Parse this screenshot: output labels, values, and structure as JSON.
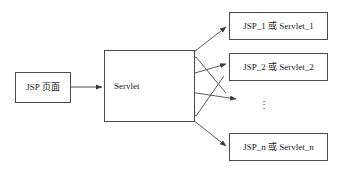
{
  "page": {
    "width": 338,
    "height": 172,
    "background": "#ffffff",
    "stroke_color": "#4a4a4a",
    "text_color": "#1c1c1c",
    "clipped_header_text": "· ···· ··· ··· ·· ··"
  },
  "diagram": {
    "type": "flow-diagram",
    "source": {
      "label": "JSP 页面"
    },
    "dispatcher": {
      "label": "Servlet"
    },
    "targets": [
      {
        "label": "JSP_1 或 Servlet_1"
      },
      {
        "label": "JSP_2 或 Servlet_2"
      },
      {
        "label": "JSP_n 或 Servlet_n"
      }
    ],
    "ellipsis": "⋮",
    "arrows": [
      {
        "from": "JSP 页面",
        "to": "Servlet"
      },
      {
        "from": "Servlet",
        "to": "JSP_1 或 Servlet_1"
      },
      {
        "from": "Servlet",
        "to": "JSP_2 或 Servlet_2"
      },
      {
        "from": "Servlet",
        "to": "ellipsis"
      },
      {
        "from": "Servlet",
        "to": "JSP_n 或 Servlet_n"
      }
    ]
  }
}
